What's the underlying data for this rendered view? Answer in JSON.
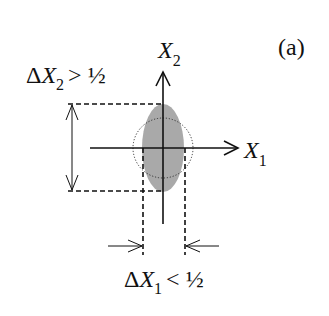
{
  "figure": {
    "panel_label": "(a)",
    "axes": {
      "x": {
        "name": "X",
        "sub": "1"
      },
      "y": {
        "name": "X",
        "sub": "2"
      }
    },
    "annotations": {
      "delta_x2": {
        "delta": "Δ",
        "var": "X",
        "sub": "2",
        "relation": "> ½"
      },
      "delta_x1": {
        "delta": "Δ",
        "var": "X",
        "sub": "1",
        "relation": "< ½"
      }
    },
    "shapes": {
      "ellipse": {
        "fill": "#a8a8a8",
        "desc": "squeezed state (gray ellipse)"
      },
      "circle": {
        "stroke": "#333333",
        "style": "dotted",
        "desc": "coherent state reference circle"
      }
    }
  }
}
